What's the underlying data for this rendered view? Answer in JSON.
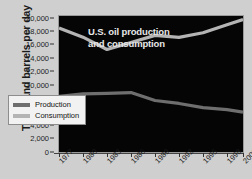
{
  "chart_data": {
    "type": "line",
    "title": "U.S. oil production and consumption",
    "xlabel": "",
    "ylabel": "Thousand barrels per day",
    "x": [
      1977,
      1980,
      1983,
      1986,
      1989,
      1992,
      1995,
      1998,
      2000
    ],
    "xtick_labels": [
      "1977",
      "1980",
      "1983",
      "1986",
      "1989",
      "1992",
      "1995",
      "1998",
      "2000"
    ],
    "ytick_labels": [
      "0",
      "2,000",
      "4,000",
      "6,000",
      "8,000",
      "10,000",
      "12,000",
      "14,000",
      "16,000",
      "18,000",
      "20,000"
    ],
    "ytick_values": [
      0,
      2000,
      4000,
      6000,
      8000,
      10000,
      12000,
      14000,
      16000,
      18000,
      20000
    ],
    "ylim": [
      0,
      20000
    ],
    "xlim": [
      1977,
      2000
    ],
    "grid": false,
    "legend_position": "lower-left-inside",
    "series": [
      {
        "name": "Production",
        "color": "#6e6e6e",
        "values": [
          8240,
          8600,
          8680,
          8800,
          7610,
          7170,
          6560,
          6250,
          5880
        ]
      },
      {
        "name": "Consumption",
        "color": "#b4b4b4",
        "values": [
          18430,
          17060,
          15230,
          16280,
          17330,
          17030,
          17720,
          18920,
          19700
        ]
      }
    ],
    "plot_background": "#050505",
    "figure_background": "#cfcfcf"
  },
  "legend": {
    "items": [
      {
        "label": "Production",
        "color": "#6e6e6e"
      },
      {
        "label": "Consumption",
        "color": "#b4b4b4"
      }
    ]
  },
  "title_lines": {
    "line1": "U.S. oil production",
    "line2": "and consumption"
  }
}
